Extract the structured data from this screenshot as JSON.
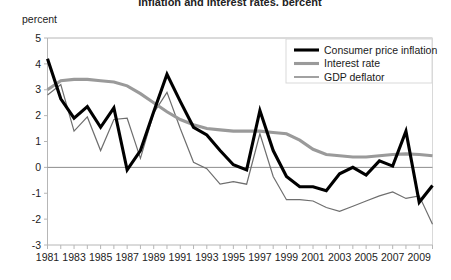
{
  "chart_data": {
    "type": "line",
    "title": "Inflation and interest rates, percent",
    "ylabel": "percent",
    "xlabel": "",
    "ylim": [
      -3,
      5
    ],
    "ytick_values": [
      5,
      4,
      3,
      2,
      1,
      0,
      -1,
      -2,
      -3
    ],
    "ytick_labels": [
      "5",
      "4",
      "3",
      "2",
      "1",
      "0",
      "-1",
      "-2",
      "-3"
    ],
    "xlim": [
      1981,
      2010
    ],
    "x": [
      1981,
      1982,
      1983,
      1984,
      1985,
      1986,
      1987,
      1988,
      1989,
      1990,
      1991,
      1992,
      1993,
      1994,
      1995,
      1996,
      1997,
      1998,
      1999,
      2000,
      2001,
      2002,
      2003,
      2004,
      2005,
      2006,
      2007,
      2008,
      2009,
      2010
    ],
    "xtick_labels": [
      "1981",
      "1983",
      "1985",
      "1987",
      "1989",
      "1991",
      "1993",
      "1995",
      "1997",
      "1999",
      "2001",
      "2003",
      "2005",
      "2007",
      "2009"
    ],
    "xtick_years": [
      1981,
      1983,
      1985,
      1987,
      1989,
      1991,
      1993,
      1995,
      1997,
      1999,
      2001,
      2003,
      2005,
      2007,
      2009
    ],
    "grid": false,
    "zero_line": true,
    "legend_position": "top-right",
    "series": [
      {
        "name": "Consumer price inflation",
        "color": "#000000",
        "width": 3.1,
        "values": [
          4.2,
          2.65,
          1.9,
          2.35,
          1.55,
          2.3,
          -0.1,
          0.65,
          2.15,
          3.6,
          2.55,
          1.55,
          1.25,
          0.65,
          0.1,
          -0.1,
          2.2,
          0.65,
          -0.35,
          -0.75,
          -0.75,
          -0.9,
          -0.25,
          0.0,
          -0.3,
          0.25,
          0.05,
          1.4,
          -1.35,
          -0.7
        ]
      },
      {
        "name": "Interest rate",
        "color": "#9a9a9a",
        "width": 3.1,
        "values": [
          3.0,
          3.35,
          3.4,
          3.4,
          3.35,
          3.3,
          3.15,
          2.85,
          2.5,
          2.15,
          1.85,
          1.65,
          1.5,
          1.45,
          1.4,
          1.4,
          1.4,
          1.35,
          1.3,
          1.05,
          0.7,
          0.5,
          0.45,
          0.4,
          0.4,
          0.45,
          0.5,
          0.52,
          0.5,
          0.45
        ]
      },
      {
        "name": "GDP deflator",
        "color": "#6e6e6e",
        "width": 1.2,
        "values": [
          2.8,
          3.2,
          1.4,
          1.95,
          0.65,
          1.85,
          1.9,
          0.35,
          2.1,
          2.9,
          1.5,
          0.2,
          -0.05,
          -0.65,
          -0.55,
          -0.65,
          1.3,
          -0.35,
          -1.25,
          -1.25,
          -1.3,
          -1.55,
          -1.7,
          -1.5,
          -1.3,
          -1.1,
          -0.95,
          -1.2,
          -1.1,
          -2.2
        ]
      }
    ]
  },
  "legend": {
    "items": [
      {
        "label": "Consumer price inflation"
      },
      {
        "label": "Interest rate"
      },
      {
        "label": "GDP deflator"
      }
    ]
  }
}
